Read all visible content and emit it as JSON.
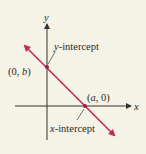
{
  "diagram": {
    "type": "line-intercepts",
    "axes": {
      "x_label": "x",
      "y_label": "y"
    },
    "points": {
      "y_intercept": {
        "label": "(0, b)",
        "annotation": "y-intercept"
      },
      "x_intercept": {
        "label": "(a, 0)",
        "annotation": "x-intercept"
      }
    },
    "colors": {
      "line": "#c8285a",
      "axis": "#333333",
      "background": "#f4f3e6"
    }
  }
}
